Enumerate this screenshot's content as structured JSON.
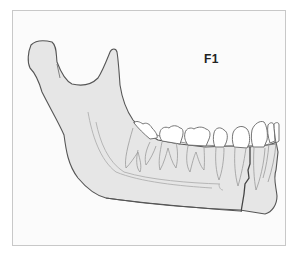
{
  "figure": {
    "fracture_label": "F1",
    "colors": {
      "background": "#ffffff",
      "frame_border": "#c8c8c8",
      "bone_fill": "#e6e6e6",
      "outline": "#555555",
      "tooth_fill": "#ffffff",
      "root_lines": "#9a9a9a",
      "canal_lines": "#b0b0b0",
      "fracture_line": "#444444"
    }
  }
}
